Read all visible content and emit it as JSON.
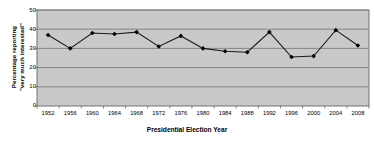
{
  "chart_data": {
    "type": "line",
    "title": "",
    "xlabel": "Presidential Election Year",
    "ylabel": "Percentage reporting \"very much interested\"",
    "ylabel_line1": "Percentage reporting",
    "ylabel_line2": "\"very much interested\"",
    "categories": [
      "1952",
      "1956",
      "1960",
      "1964",
      "1968",
      "1972",
      "1976",
      "1980",
      "1984",
      "1988",
      "1992",
      "1996",
      "2000",
      "2004",
      "2008"
    ],
    "values": [
      37,
      30,
      38,
      37.5,
      38.5,
      31,
      36.5,
      30,
      28.5,
      28,
      38.5,
      25.5,
      26,
      39.5,
      31.5
    ],
    "ylim": [
      0,
      50
    ],
    "yticks": [
      0,
      10,
      20,
      30,
      40,
      50
    ],
    "ytick_labels": [
      "0",
      "10",
      "20",
      "30",
      "40",
      "50"
    ],
    "grid": true,
    "grid_axis": "y",
    "legend": false,
    "legend_position": "none",
    "marker": "diamond",
    "colors": {
      "plot_background": "#c9c9c9",
      "gridline": "#7d7d7d",
      "line": "#1a1a1a",
      "marker": "#000000",
      "page_background": "#ffffff",
      "axis": "#555555",
      "text": "#000000"
    }
  }
}
